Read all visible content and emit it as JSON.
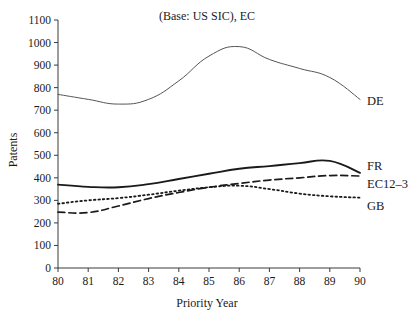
{
  "chart_data": {
    "type": "line",
    "title": "(Base: US SIC), EC",
    "xlabel": "Priority Year",
    "ylabel": "Patents",
    "x": [
      80,
      81,
      82,
      83,
      84,
      85,
      86,
      87,
      88,
      89,
      90
    ],
    "xtick_labels": [
      "80",
      "81",
      "82",
      "83",
      "84",
      "85",
      "86",
      "87",
      "88",
      "89",
      "90"
    ],
    "ytick_labels": [
      "0",
      "100",
      "200",
      "300",
      "400",
      "500",
      "600",
      "700",
      "800",
      "900",
      "1000",
      "1100"
    ],
    "ytick_values": [
      0,
      100,
      200,
      300,
      400,
      500,
      600,
      700,
      800,
      900,
      1000,
      1100
    ],
    "xlim": [
      80,
      90
    ],
    "ylim": [
      0,
      1100
    ],
    "grid": false,
    "legend_position": "right-of-line-ends",
    "series": [
      {
        "name": "DE",
        "label": "DE",
        "style": "solid-thin",
        "color": "#555555",
        "values": [
          770,
          748,
          727,
          748,
          830,
          940,
          982,
          925,
          885,
          845,
          748
        ]
      },
      {
        "name": "FR",
        "label": "FR",
        "style": "solid-thick",
        "color": "#1a1a1a",
        "values": [
          370,
          360,
          358,
          372,
          395,
          418,
          440,
          452,
          465,
          475,
          422
        ]
      },
      {
        "name": "EC12-3",
        "label": "EC12–3",
        "style": "dashed",
        "color": "#1a1a1a",
        "values": [
          248,
          246,
          275,
          308,
          335,
          358,
          375,
          390,
          400,
          410,
          408
        ]
      },
      {
        "name": "GB",
        "label": "GB",
        "style": "dotted",
        "color": "#1a1a1a",
        "values": [
          285,
          300,
          310,
          325,
          343,
          358,
          365,
          350,
          330,
          318,
          312
        ]
      }
    ]
  }
}
